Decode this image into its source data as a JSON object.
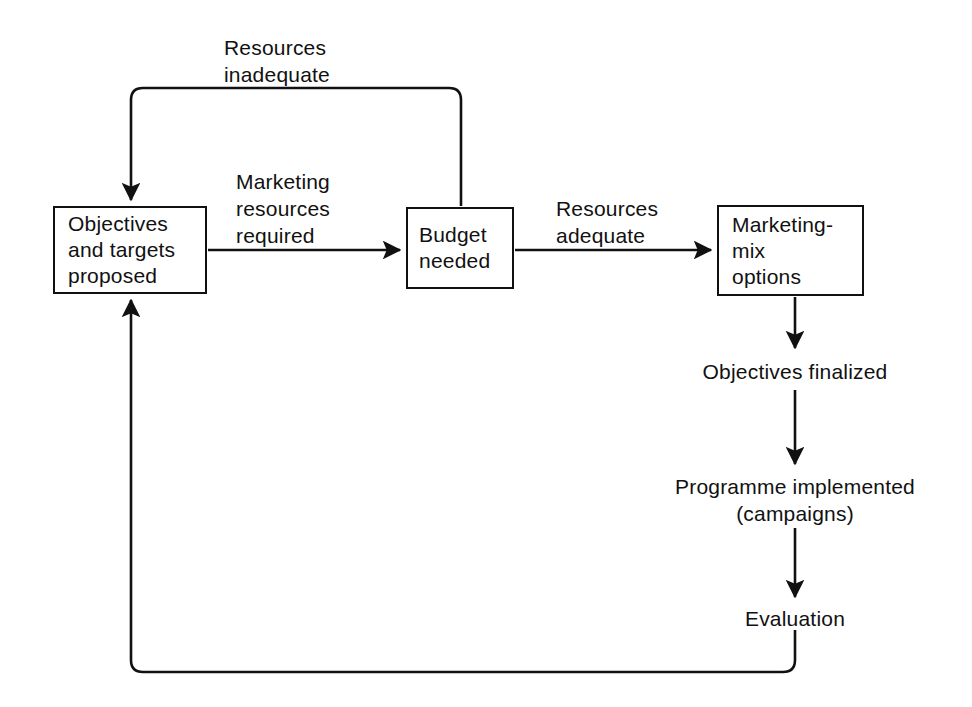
{
  "diagram": {
    "type": "flowchart",
    "background_color": "#ffffff",
    "line_color": "#111111",
    "text_color": "#111111",
    "nodes": [
      {
        "id": "objectives",
        "shape": "rectangle",
        "lines": [
          "Objectives",
          "and targets",
          "proposed"
        ],
        "x": 53,
        "y": 206,
        "w": 154,
        "h": 88
      },
      {
        "id": "budget",
        "shape": "rectangle",
        "lines": [
          "Budget",
          "needed"
        ],
        "x": 406,
        "y": 207,
        "w": 108,
        "h": 82
      },
      {
        "id": "marketing-mix",
        "shape": "rectangle",
        "lines": [
          "Marketing-",
          "mix",
          "options"
        ],
        "x": 717,
        "y": 205,
        "w": 147,
        "h": 91
      }
    ],
    "edge_labels": [
      {
        "id": "resources-inadequate",
        "lines": [
          "Resources",
          "inadequate"
        ],
        "x": 224,
        "y": 34
      },
      {
        "id": "marketing-resources-required",
        "lines": [
          "Marketing",
          "resources",
          "required"
        ],
        "x": 236,
        "y": 168
      },
      {
        "id": "resources-adequate",
        "lines": [
          "Resources",
          "adequate"
        ],
        "x": 556,
        "y": 195
      }
    ],
    "stage_labels": [
      {
        "id": "objectives-finalized",
        "lines": [
          "Objectives finalized"
        ],
        "cx": 795,
        "y": 358
      },
      {
        "id": "programme-implemented",
        "lines": [
          "Programme implemented",
          "(campaigns)"
        ],
        "cx": 795,
        "y": 473
      },
      {
        "id": "evaluation",
        "lines": [
          "Evaluation"
        ],
        "cx": 795,
        "y": 605
      }
    ],
    "connectors": [
      {
        "id": "objectives-to-budget",
        "from": "objectives",
        "to": "budget",
        "label": "marketing-resources-required",
        "direction": "right"
      },
      {
        "id": "budget-to-marketing-mix",
        "from": "budget",
        "to": "marketing-mix",
        "label": "resources-adequate",
        "direction": "right"
      },
      {
        "id": "budget-to-objectives-feedback",
        "from": "budget",
        "to": "objectives",
        "label": "resources-inadequate",
        "direction": "up-left-down"
      },
      {
        "id": "marketing-mix-to-objectives-finalized",
        "from": "marketing-mix",
        "to": "objectives-finalized",
        "direction": "down"
      },
      {
        "id": "objectives-finalized-to-programme",
        "from": "objectives-finalized",
        "to": "programme-implemented",
        "direction": "down"
      },
      {
        "id": "programme-to-evaluation",
        "from": "programme-implemented",
        "to": "evaluation",
        "direction": "down"
      },
      {
        "id": "evaluation-to-objectives-feedback",
        "from": "evaluation",
        "to": "objectives",
        "direction": "down-left-up"
      }
    ]
  }
}
